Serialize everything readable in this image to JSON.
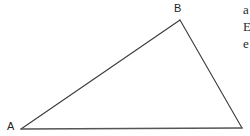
{
  "figure": {
    "type": "geometry-diagram",
    "shape": "triangle",
    "background_color": "#ffffff",
    "width": 250,
    "height": 136,
    "stroke_color": "#3a3a3a",
    "base_stroke_color": "#555555",
    "label_color": "#232323",
    "vertices": [
      {
        "id": "A",
        "label": "A",
        "x": 21,
        "y": 129,
        "labeled": true
      },
      {
        "id": "B",
        "label": "B",
        "x": 180,
        "y": 20,
        "labeled": true
      },
      {
        "id": "C",
        "label": "",
        "x": 242,
        "y": 128,
        "labeled": false
      }
    ],
    "edges": [
      {
        "id": "AB",
        "from": "A",
        "to": "B",
        "stroke_width": 1.1
      },
      {
        "id": "BC",
        "from": "B",
        "to": "C",
        "stroke_width": 1.1
      },
      {
        "id": "CA",
        "from": "C",
        "to": "A",
        "stroke_width": 1.6
      }
    ]
  },
  "clipped_text": {
    "description": "right-edge-clipped-text",
    "lines": [
      "a",
      "E",
      "e"
    ]
  }
}
